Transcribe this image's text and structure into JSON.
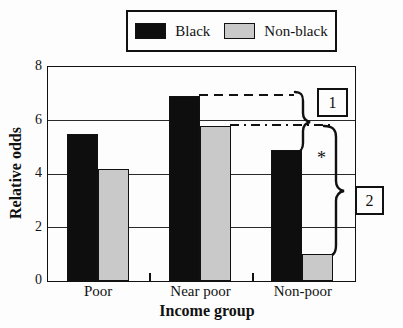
{
  "legend": {
    "items": [
      {
        "label": "Black",
        "color": "#0e0e0e"
      },
      {
        "label": "Non-black",
        "color": "#c9c9c9"
      }
    ]
  },
  "chart_data": {
    "type": "bar",
    "title": "",
    "xlabel": "Income group",
    "ylabel": "Relative odds",
    "ylim": [
      0,
      8
    ],
    "yticks": [
      0,
      2,
      4,
      6,
      8
    ],
    "grid": true,
    "legend_position": "top",
    "categories": [
      "Poor",
      "Near poor",
      "Non-poor"
    ],
    "series": [
      {
        "name": "Black",
        "color": "#0e0e0e",
        "values": [
          5.5,
          6.9,
          4.9
        ]
      },
      {
        "name": "Non-black",
        "color": "#c9c9c9",
        "values": [
          4.2,
          5.8,
          1.0
        ]
      }
    ],
    "annotations": {
      "bracket_1_label": "1",
      "bracket_2_label": "2",
      "significance_marker": "*",
      "dashed_line_1_value": 6.9,
      "dashed_line_2_value": 5.8
    }
  }
}
